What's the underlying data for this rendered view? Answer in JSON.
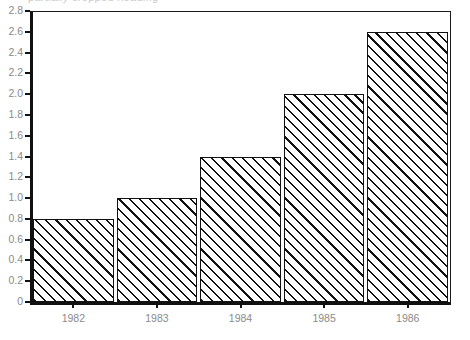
{
  "chart_data": {
    "type": "bar",
    "title": "",
    "xlabel": "",
    "ylabel": "",
    "categories": [
      "1982",
      "1983",
      "1984",
      "1985",
      "1986"
    ],
    "values": [
      0.8,
      1.0,
      1.4,
      2.0,
      2.6
    ],
    "ylim": [
      0,
      2.8
    ],
    "ytick_labels": [
      "0",
      "0.2",
      "0.4",
      "0.6",
      "0.8",
      "1.0",
      "1.2",
      "1.4",
      "1.6",
      "1.8",
      "2.0",
      "2.2",
      "2.4",
      "2.6",
      "2.8"
    ],
    "ytick_values": [
      0,
      0.2,
      0.4,
      0.6,
      0.8,
      1.0,
      1.2,
      1.4,
      1.6,
      1.8,
      2.0,
      2.2,
      2.4,
      2.6,
      2.8
    ],
    "grid": false,
    "legend": null,
    "legend_position": "none",
    "series": [
      {
        "name": "",
        "values": [
          0.8,
          1.0,
          1.4,
          2.0,
          2.6
        ],
        "fill": "diagonal-hatch",
        "fill_color": "#ffffff",
        "hatch_color": "#111111",
        "edge_color": "#111111"
      }
    ]
  },
  "style": {
    "background": "#ffffff",
    "axis_color": "#111111",
    "tick_label_color": "#8a8a8a",
    "frame_color": "#1a1a1a"
  },
  "header": {
    "clipped_title": "partially cropped heading"
  }
}
